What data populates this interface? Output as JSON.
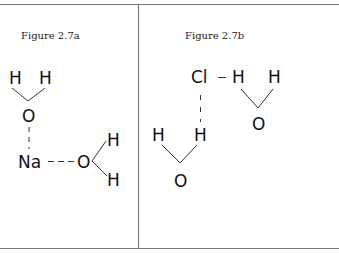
{
  "panels": [
    {
      "caption": "Figure 2.7a",
      "atoms": {
        "h1": "H",
        "h2": "H",
        "o1": "O",
        "na": "Na",
        "o2": "O",
        "h3": "H",
        "h4": "H"
      },
      "interactions": [
        "O···Na (ion–dipole)",
        "Na···O (ion–dipole)"
      ]
    },
    {
      "caption": "Figure 2.7b",
      "atoms": {
        "cl": "Cl",
        "h1": "H",
        "h2": "H",
        "o1": "O",
        "h3": "H",
        "h4": "H",
        "o2": "O"
      },
      "interactions": [
        "Cl–H covalent",
        "Cl···H hydrogen bond"
      ]
    }
  ],
  "colors": {
    "line": "#333333",
    "border": "#777777",
    "text": "#111111",
    "background": "#ffffff"
  }
}
